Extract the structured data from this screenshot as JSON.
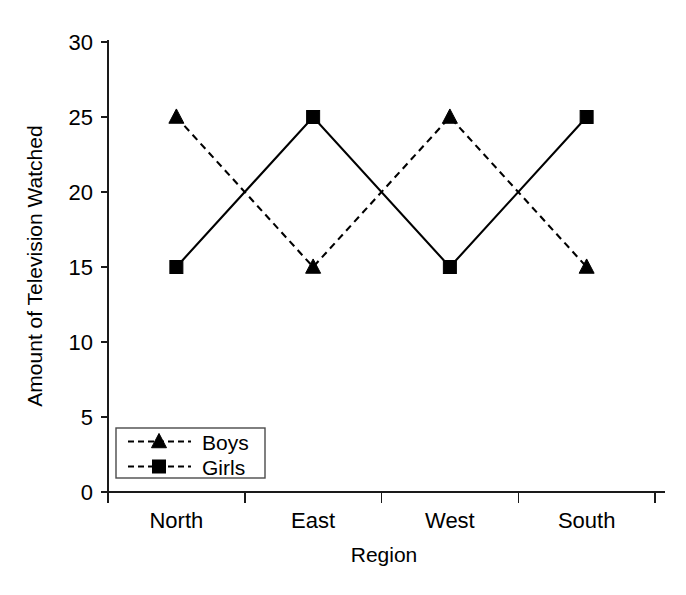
{
  "chart_data": {
    "type": "line",
    "title": "",
    "xlabel": "Region",
    "ylabel": "Amount of Television Watched",
    "categories": [
      "North",
      "East",
      "West",
      "South"
    ],
    "series": [
      {
        "name": "Boys",
        "values": [
          25,
          15,
          25,
          15
        ],
        "marker": "triangle",
        "linestyle": "dashed",
        "color": "#000000"
      },
      {
        "name": "Girls",
        "values": [
          15,
          25,
          15,
          25
        ],
        "marker": "square",
        "linestyle": "solid",
        "color": "#000000"
      }
    ],
    "ylim": [
      0,
      30
    ],
    "yticks": [
      0,
      5,
      10,
      15,
      20,
      25,
      30
    ],
    "ytick_labels": [
      "0",
      "5",
      "10",
      "15",
      "20",
      "25",
      "30"
    ],
    "grid": false,
    "legend_position": "lower-left",
    "legend_entries": [
      "Boys",
      "Girls"
    ]
  },
  "axes": {
    "y_title": "Amount of Television Watched",
    "x_title": "Region"
  },
  "legend": {
    "items": [
      {
        "label": "Boys"
      },
      {
        "label": "Girls"
      }
    ]
  },
  "colors": {
    "ink": "#000000",
    "axis": "#1a1a1a",
    "legend_border": "#4a4a4a",
    "background": "#ffffff"
  }
}
